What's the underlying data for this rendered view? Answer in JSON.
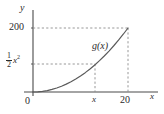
{
  "figure": {
    "axis_labels": {
      "x": "x",
      "y": "y"
    },
    "origin_label": "0",
    "curve_label": "g(x)",
    "y_ticks": [
      {
        "label": "200",
        "value": 200
      },
      {
        "label_num": "1",
        "label_den": "2",
        "label_base": "x",
        "label_exp": "2",
        "value": 50
      }
    ],
    "x_ticks": [
      {
        "label": "x",
        "value": 10
      },
      {
        "label": "20",
        "value": 20
      }
    ]
  },
  "chart_data": {
    "type": "line",
    "title": "",
    "xlabel": "x",
    "ylabel": "y",
    "xlim": [
      0,
      23
    ],
    "ylim": [
      0,
      225
    ],
    "grid": false,
    "legend": "none",
    "series": [
      {
        "name": "g(x)",
        "formula": "y = 0.5 * x^2",
        "x": [
          0,
          1,
          2,
          3,
          4,
          5,
          6,
          7,
          8,
          9,
          10,
          11,
          12,
          13,
          14,
          15,
          16,
          17,
          18,
          19,
          20
        ],
        "y": [
          0,
          0.5,
          2,
          4.5,
          8,
          12.5,
          18,
          24.5,
          32,
          40.5,
          50,
          60.5,
          72,
          84.5,
          98,
          112.5,
          128,
          144.5,
          162,
          180.5,
          200
        ]
      }
    ],
    "annotations": [
      {
        "text": "g(x)",
        "x": 11.5,
        "y": 110
      },
      {
        "text": "200",
        "axis": "y",
        "value": 200
      },
      {
        "text": "1/2 x^2",
        "axis": "y",
        "value": 50
      },
      {
        "text": "x",
        "axis": "x",
        "value": 10
      },
      {
        "text": "20",
        "axis": "x",
        "value": 20
      },
      {
        "text": "0",
        "axis": "origin"
      }
    ],
    "guide_lines": [
      {
        "type": "horizontal",
        "y": 200,
        "from_x": 0,
        "to_x": 20,
        "style": "dashed"
      },
      {
        "type": "horizontal",
        "y": 50,
        "from_x": 0,
        "to_x": 10,
        "style": "dashed"
      },
      {
        "type": "vertical",
        "x": 10,
        "from_y": 0,
        "to_y": 50,
        "style": "dashed"
      },
      {
        "type": "vertical",
        "x": 20,
        "from_y": 0,
        "to_y": 200,
        "style": "dashed"
      }
    ],
    "colors": {
      "axis": "#4a4a4a",
      "curve": "#5a5a5a",
      "guide": "#8c8c8c",
      "text": "#2b2b2b"
    }
  }
}
